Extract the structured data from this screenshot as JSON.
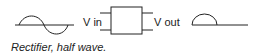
{
  "diagram": {
    "input_label": "V in",
    "output_label": "V out",
    "caption": "Rectifier, half wave.",
    "stroke_color": "#222222",
    "input_waveform": "sine-wave-icon",
    "output_waveform": "half-wave-icon",
    "component": "rectifier-box"
  }
}
